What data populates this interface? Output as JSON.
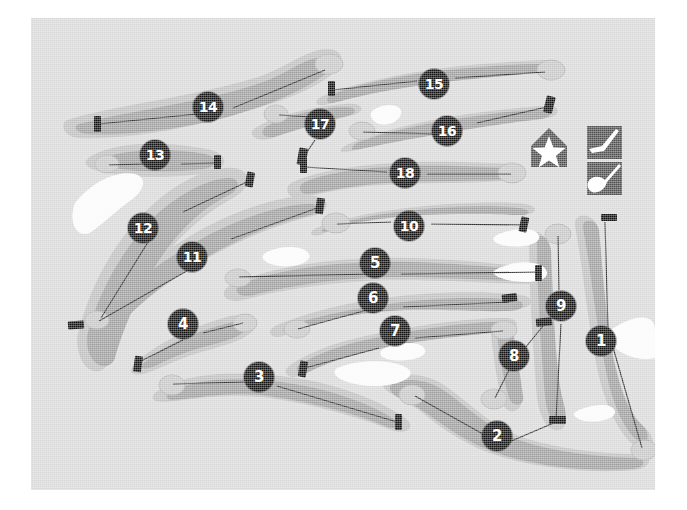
{
  "map": {
    "title": "Golf Course Layout Map",
    "background_color": "#d8d8d8",
    "rough_color": "#b4b4b4",
    "fairway_color": "#9a9a9a",
    "green_color": "#c3c3c3",
    "bunker_color": "#fbfbfb",
    "tee_color": "#121212",
    "badge_color": "#121212",
    "badge_text_color": "#ffffff",
    "centerline_color": "#2a2a2a"
  },
  "legend": {
    "clubhouse": {
      "name": "clubhouse-icon",
      "label": "Clubhouse"
    },
    "items": [
      {
        "name": "iron-club-icon",
        "label": "Iron"
      },
      {
        "name": "wood-club-icon",
        "label": "Wood"
      }
    ]
  },
  "holes": [
    {
      "number": "1",
      "badge_x": 570,
      "badge_y": 323,
      "tee_x": 574,
      "tee_y": 202,
      "green_x": 613,
      "green_y": 432
    },
    {
      "number": "2",
      "badge_x": 466,
      "badge_y": 418,
      "tee_x": 525,
      "tee_y": 403,
      "green_x": 381,
      "green_y": 376
    },
    {
      "number": "3",
      "badge_x": 228,
      "badge_y": 359,
      "tee_x": 368,
      "tee_y": 404,
      "green_x": 140,
      "green_y": 366
    },
    {
      "number": "4",
      "badge_x": 152,
      "badge_y": 306,
      "tee_x": 107,
      "tee_y": 345,
      "green_x": 213,
      "green_y": 305
    },
    {
      "number": "5",
      "badge_x": 344,
      "badge_y": 245,
      "tee_x": 508,
      "tee_y": 253,
      "green_x": 208,
      "green_y": 259
    },
    {
      "number": "6",
      "badge_x": 342,
      "badge_y": 280,
      "tee_x": 477,
      "tee_y": 282,
      "green_x": 265,
      "green_y": 310
    },
    {
      "number": "7",
      "badge_x": 364,
      "badge_y": 313,
      "tee_x": 273,
      "tee_y": 350,
      "green_x": 470,
      "green_y": 312
    },
    {
      "number": "8",
      "badge_x": 483,
      "badge_y": 338,
      "tee_x": 512,
      "tee_y": 305,
      "green_x": 463,
      "green_y": 379
    },
    {
      "number": "9",
      "badge_x": 530,
      "badge_y": 288,
      "tee_x": 524,
      "tee_y": 403,
      "green_x": 527,
      "green_y": 215
    },
    {
      "number": "10",
      "badge_x": 378,
      "badge_y": 208,
      "tee_x": 495,
      "tee_y": 206,
      "green_x": 304,
      "green_y": 206
    },
    {
      "number": "11",
      "badge_x": 161,
      "badge_y": 239,
      "tee_x": 288,
      "tee_y": 187,
      "green_x": 70,
      "green_y": 303
    },
    {
      "number": "12",
      "badge_x": 112,
      "badge_y": 210,
      "tee_x": 219,
      "tee_y": 159,
      "green_x": 56,
      "green_y": 308
    },
    {
      "number": "13",
      "badge_x": 124,
      "badge_y": 137,
      "tee_x": 186,
      "tee_y": 143,
      "green_x": 77,
      "green_y": 148
    },
    {
      "number": "14",
      "badge_x": 177,
      "badge_y": 89,
      "tee_x": 67,
      "tee_y": 104,
      "green_x": 294,
      "green_y": 51
    },
    {
      "number": "15",
      "badge_x": 403,
      "badge_y": 66,
      "tee_x": 301,
      "tee_y": 70,
      "green_x": 516,
      "green_y": 54
    },
    {
      "number": "16",
      "badge_x": 416,
      "badge_y": 113,
      "tee_x": 520,
      "tee_y": 85,
      "green_x": 330,
      "green_y": 113
    },
    {
      "number": "17",
      "badge_x": 289,
      "badge_y": 106,
      "tee_x": 271,
      "tee_y": 138,
      "green_x": 246,
      "green_y": 96
    },
    {
      "number": "18",
      "badge_x": 374,
      "badge_y": 155,
      "tee_x": 272,
      "tee_y": 146,
      "green_x": 478,
      "green_y": 155
    }
  ]
}
